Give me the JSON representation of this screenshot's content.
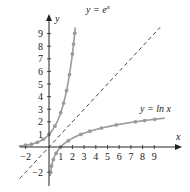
{
  "chart_data": {
    "type": "line",
    "title": "",
    "xlabel": "x",
    "ylabel": "y",
    "xlim": [
      -2.5,
      10
    ],
    "ylim": [
      -3,
      10
    ],
    "grid": false,
    "x_ticks": [
      -2,
      1,
      2,
      3,
      4,
      5,
      6,
      7,
      8,
      9
    ],
    "y_ticks": [
      -2,
      1,
      2,
      3,
      4,
      5,
      6,
      7,
      8,
      9
    ],
    "series": [
      {
        "name": "y = e^x",
        "label": "y = e",
        "label_sup": "x",
        "function": "exp",
        "x": [
          -2,
          -1.5,
          -1,
          -0.5,
          0,
          0.5,
          1,
          1.25,
          1.5,
          1.75,
          2,
          2.1,
          2.2
        ],
        "values": [
          0.14,
          0.22,
          0.37,
          0.61,
          1,
          1.65,
          2.72,
          3.49,
          4.48,
          5.75,
          7.39,
          8.17,
          9.03
        ],
        "color": "#9a9a9a"
      },
      {
        "name": "y = ln x",
        "label": "y = ln x",
        "function": "ln",
        "x": [
          0.14,
          0.22,
          0.37,
          0.61,
          1,
          1.65,
          2.72,
          3.49,
          4.48,
          5.75,
          7.39,
          8.17,
          9.03
        ],
        "values": [
          -2,
          -1.5,
          -1,
          -0.5,
          0,
          0.5,
          1,
          1.25,
          1.5,
          1.75,
          2,
          2.1,
          2.2
        ],
        "color": "#9a9a9a"
      },
      {
        "name": "y = x",
        "label": "",
        "function": "identity",
        "style": "dashed",
        "x": [
          -2.5,
          9.5
        ],
        "values": [
          -2.5,
          9.5
        ],
        "color": "#333333"
      }
    ]
  },
  "labels": {
    "x_axis": "x",
    "y_axis": "y",
    "exp_curve": "y = e",
    "exp_sup": "x",
    "ln_curve": "y = ln x"
  }
}
